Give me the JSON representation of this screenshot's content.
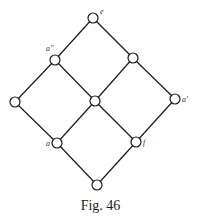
{
  "figure": {
    "caption": "Fig. 46",
    "type": "Hasse diagram (lattice)",
    "nodes": [
      {
        "id": "e",
        "label": "e",
        "x": 93,
        "y": 18,
        "lx": 100,
        "ly": 14
      },
      {
        "id": "a2",
        "label": "a''",
        "x": 55,
        "y": 60,
        "lx": 46,
        "ly": 51
      },
      {
        "id": "n3",
        "label": "",
        "x": 133,
        "y": 58,
        "lx": 0,
        "ly": 0
      },
      {
        "id": "n4",
        "label": "",
        "x": 15,
        "y": 102,
        "lx": 0,
        "ly": 0
      },
      {
        "id": "n5",
        "label": "",
        "x": 95,
        "y": 101,
        "lx": 0,
        "ly": 0
      },
      {
        "id": "a1",
        "label": "a'",
        "x": 175,
        "y": 99,
        "lx": 182,
        "ly": 102
      },
      {
        "id": "a",
        "label": "a",
        "x": 57,
        "y": 143,
        "lx": 46,
        "ly": 146
      },
      {
        "id": "f",
        "label": "f",
        "x": 136,
        "y": 142,
        "lx": 143,
        "ly": 145
      },
      {
        "id": "n9",
        "label": "",
        "x": 97,
        "y": 185,
        "lx": 0,
        "ly": 0
      }
    ],
    "edges": [
      [
        "e",
        "a2"
      ],
      [
        "e",
        "n3"
      ],
      [
        "a2",
        "n4"
      ],
      [
        "a2",
        "n5"
      ],
      [
        "n3",
        "n5"
      ],
      [
        "n3",
        "a1"
      ],
      [
        "n4",
        "a"
      ],
      [
        "n5",
        "a"
      ],
      [
        "n5",
        "f"
      ],
      [
        "a1",
        "f"
      ],
      [
        "a",
        "n9"
      ],
      [
        "f",
        "n9"
      ]
    ],
    "node_radius": 5,
    "colors": {
      "line": "#1a1a1a",
      "fill": "#ffffff",
      "label": "#333333"
    }
  }
}
